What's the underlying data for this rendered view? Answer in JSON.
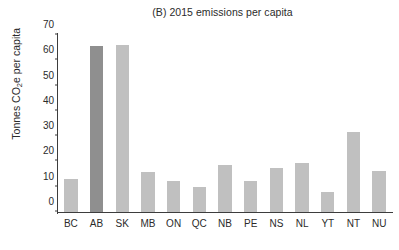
{
  "chart_data": {
    "type": "bar",
    "title": "(B) 2015 emissions per capita",
    "xlabel": "",
    "ylabel": "Tonnes CO2e per capita",
    "ylabel_prefix": "Tonnes CO",
    "ylabel_sub": "2",
    "ylabel_suffix": "e per capita",
    "categories": [
      "BC",
      "AB",
      "SK",
      "MB",
      "ON",
      "QC",
      "NB",
      "PE",
      "NS",
      "NL",
      "YT",
      "NT",
      "NU"
    ],
    "values": [
      13.0,
      65.5,
      66.0,
      15.8,
      12.3,
      9.8,
      18.7,
      12.3,
      17.3,
      19.5,
      8.0,
      31.8,
      16.2
    ],
    "bar_colors": [
      "#c0c0c0",
      "#8f8f8f",
      "#c0c0c0",
      "#c0c0c0",
      "#c0c0c0",
      "#c0c0c0",
      "#c0c0c0",
      "#c0c0c0",
      "#c0c0c0",
      "#c0c0c0",
      "#c0c0c0",
      "#c0c0c0",
      "#c0c0c0"
    ],
    "ylim": [
      0,
      70
    ],
    "yticks": [
      0,
      10,
      20,
      30,
      40,
      50,
      60,
      70
    ],
    "grid": false,
    "legend": "none",
    "axis_color": "#3d3d3d",
    "background": "#ffffff",
    "highlight_category": "AB",
    "highlight_color": "#8f8f8f",
    "default_bar_color": "#c0c0c0"
  }
}
